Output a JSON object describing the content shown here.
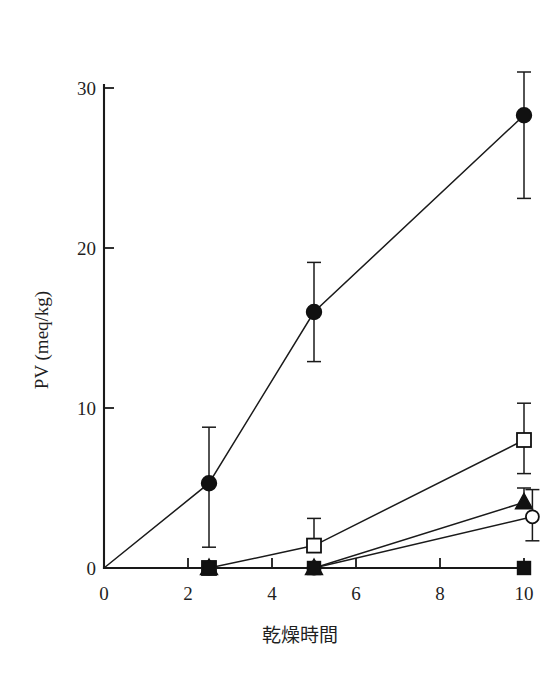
{
  "figure": {
    "background_color": "#ffffff",
    "ink_color": "#1a1a1a",
    "caption": ""
  },
  "chart_data": {
    "type": "line",
    "title": "",
    "subtitle": "",
    "xlabel": "乾燥時間",
    "ylabel": "PV (meq/kg)",
    "xlim": [
      0,
      10.6
    ],
    "ylim": [
      0,
      31.5
    ],
    "xticks": [
      0,
      2,
      4,
      6,
      8,
      10
    ],
    "xticklabels": [
      "0",
      "2",
      "4",
      "6",
      "8",
      "10"
    ],
    "yticks": [
      0,
      10,
      20,
      30
    ],
    "yticklabels": [
      "0",
      "10",
      "20",
      "30"
    ],
    "grid": false,
    "legend": "none",
    "error_bars": "vertical",
    "series": [
      {
        "name": "filled-circle",
        "marker": "filled-circle",
        "x": [
          0,
          2.5,
          5,
          10
        ],
        "values": [
          0,
          5.3,
          16.0,
          28.3
        ],
        "err_low": [
          0,
          4.0,
          3.1,
          5.2
        ],
        "err_high": [
          0,
          3.5,
          3.1,
          2.7
        ]
      },
      {
        "name": "open-square",
        "marker": "open-square",
        "x": [
          0,
          2.5,
          5,
          10
        ],
        "values": [
          0,
          0,
          1.4,
          8.0
        ],
        "err_low": [
          0,
          0,
          0,
          2.1
        ],
        "err_high": [
          0,
          0,
          1.7,
          2.3
        ]
      },
      {
        "name": "filled-triangle",
        "marker": "filled-triangle",
        "x": [
          0,
          2.5,
          5,
          10
        ],
        "values": [
          0,
          0,
          0,
          4.1
        ],
        "err_low": [
          0,
          0,
          0,
          0
        ],
        "err_high": [
          0,
          0,
          0,
          0.9
        ]
      },
      {
        "name": "open-circle",
        "marker": "open-circle",
        "x": [
          0,
          2.5,
          5,
          10.2
        ],
        "values": [
          0,
          0,
          0,
          3.2
        ],
        "err_low": [
          0,
          0,
          0,
          1.5
        ],
        "err_high": [
          0,
          0,
          0,
          1.7
        ]
      },
      {
        "name": "filled-square",
        "marker": "filled-square",
        "x": [
          0,
          2.5,
          5,
          10
        ],
        "values": [
          0,
          0,
          0,
          0
        ],
        "err_low": [
          0,
          0,
          0,
          0
        ],
        "err_high": [
          0,
          0,
          0,
          0
        ]
      }
    ]
  }
}
